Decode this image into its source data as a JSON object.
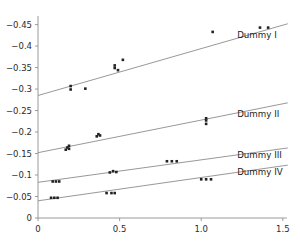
{
  "chart_data": {
    "type": "scatter",
    "title": "",
    "xlabel": "",
    "ylabel": "",
    "xlim": [
      0,
      1.55
    ],
    "ylim": [
      0,
      -0.47
    ],
    "y_axis_inverted": true,
    "grid": false,
    "legend_position": "inline-right-of-each-line",
    "xticks": [
      0,
      0.5,
      1.0,
      1.5
    ],
    "xticklabels": [
      "0",
      "0.5",
      "1.0",
      "1.5"
    ],
    "yticks": [
      0,
      -0.05,
      -0.1,
      -0.15,
      -0.2,
      -0.25,
      -0.3,
      -0.35,
      -0.4,
      -0.45
    ],
    "yticklabels": [
      "0",
      "−0.05",
      "−0.1",
      "−0.15",
      "−0.2",
      "−0.25",
      "−0.3",
      "−0.35",
      "−0.4",
      "−0.45"
    ],
    "marker": "square",
    "marker_color": "#222222",
    "line_color": "#8c8c8c",
    "axis_color": "#9a9a9a",
    "series": [
      {
        "name": "Dummy I",
        "label": "Dummy I",
        "label_x": 1.22,
        "label_y": -0.425,
        "fit_line": {
          "x0": 0.0,
          "y0": -0.285,
          "x1": 1.53,
          "y1": -0.452
        },
        "points": [
          {
            "x": 0.2,
            "y": -0.299
          },
          {
            "x": 0.2,
            "y": -0.307
          },
          {
            "x": 0.29,
            "y": -0.301
          },
          {
            "x": 0.47,
            "y": -0.355
          },
          {
            "x": 0.47,
            "y": -0.349
          },
          {
            "x": 0.49,
            "y": -0.344
          },
          {
            "x": 0.52,
            "y": -0.368
          },
          {
            "x": 1.07,
            "y": -0.433
          },
          {
            "x": 1.36,
            "y": -0.443
          },
          {
            "x": 1.41,
            "y": -0.443
          }
        ]
      },
      {
        "name": "Dummy II",
        "label": "Dummy II",
        "label_x": 1.22,
        "label_y": -0.243,
        "fit_line": {
          "x0": 0.0,
          "y0": -0.152,
          "x1": 1.53,
          "y1": -0.268
        },
        "points": [
          {
            "x": 0.17,
            "y": -0.159
          },
          {
            "x": 0.18,
            "y": -0.164
          },
          {
            "x": 0.19,
            "y": -0.161
          },
          {
            "x": 0.19,
            "y": -0.168
          },
          {
            "x": 0.36,
            "y": -0.19
          },
          {
            "x": 0.37,
            "y": -0.195
          },
          {
            "x": 0.38,
            "y": -0.192
          },
          {
            "x": 1.03,
            "y": -0.227
          },
          {
            "x": 1.03,
            "y": -0.232
          },
          {
            "x": 1.03,
            "y": -0.219
          }
        ]
      },
      {
        "name": "Dummy III",
        "label": "Dummy III",
        "label_x": 1.22,
        "label_y": -0.146,
        "fit_line": {
          "x0": 0.0,
          "y0": -0.083,
          "x1": 1.53,
          "y1": -0.163
        },
        "points": [
          {
            "x": 0.09,
            "y": -0.085
          },
          {
            "x": 0.11,
            "y": -0.085
          },
          {
            "x": 0.13,
            "y": -0.085
          },
          {
            "x": 0.44,
            "y": -0.106
          },
          {
            "x": 0.46,
            "y": -0.109
          },
          {
            "x": 0.48,
            "y": -0.107
          },
          {
            "x": 0.79,
            "y": -0.132
          },
          {
            "x": 0.82,
            "y": -0.132
          },
          {
            "x": 0.85,
            "y": -0.132
          }
        ]
      },
      {
        "name": "Dummy IV",
        "label": "Dummy IV",
        "label_x": 1.22,
        "label_y": -0.106,
        "fit_line": {
          "x0": 0.0,
          "y0": -0.04,
          "x1": 1.53,
          "y1": -0.123
        },
        "points": [
          {
            "x": 0.08,
            "y": -0.047
          },
          {
            "x": 0.1,
            "y": -0.047
          },
          {
            "x": 0.12,
            "y": -0.047
          },
          {
            "x": 0.42,
            "y": -0.058
          },
          {
            "x": 0.45,
            "y": -0.058
          },
          {
            "x": 0.47,
            "y": -0.058
          },
          {
            "x": 1.0,
            "y": -0.09
          },
          {
            "x": 1.03,
            "y": -0.09
          },
          {
            "x": 1.06,
            "y": -0.09
          }
        ]
      }
    ]
  }
}
